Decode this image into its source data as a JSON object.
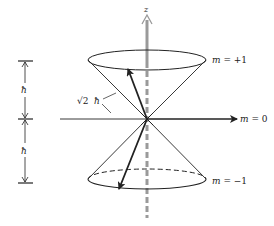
{
  "diagram": {
    "type": "vector-model-angular-momentum",
    "axis_label": "z",
    "states": [
      {
        "label": "m = +1",
        "m": "m",
        "rest": " = +1"
      },
      {
        "label": "m = 0",
        "m": "m",
        "rest": " = 0"
      },
      {
        "label": "m = −1",
        "m": "m",
        "rest": " = −1"
      }
    ],
    "vector_length_label": {
      "root": "√2",
      "hbar": "ħ"
    },
    "dimension_labels": {
      "upper": "ħ",
      "lower": "ħ"
    },
    "colors": {
      "line": "#222222",
      "axis": "#9a9a9a",
      "background": "#ffffff"
    }
  }
}
